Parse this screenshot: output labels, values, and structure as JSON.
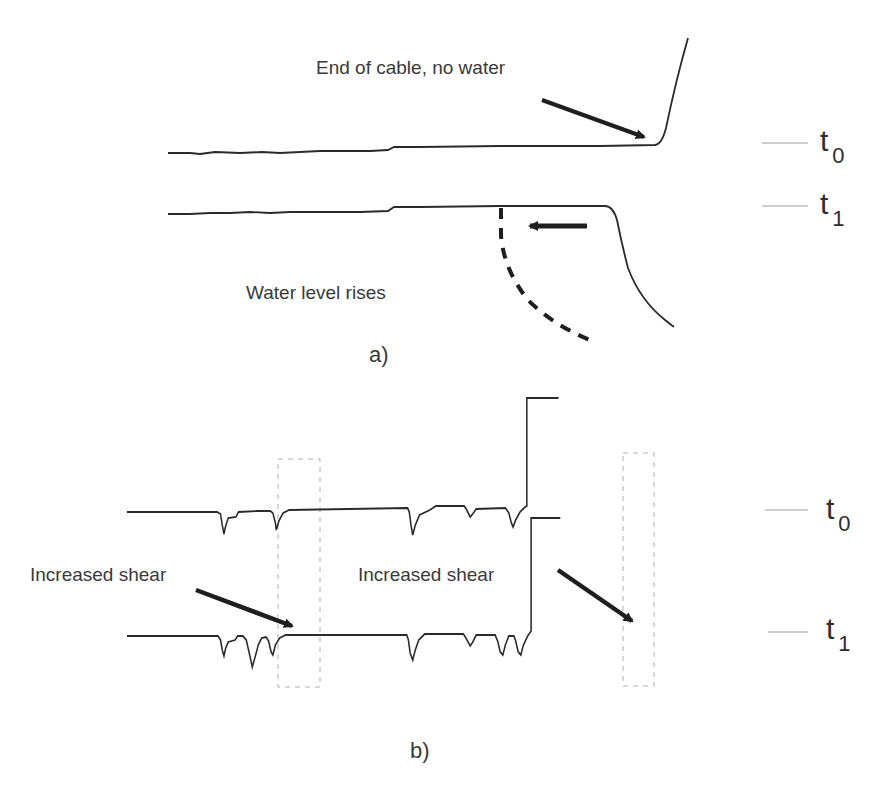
{
  "panel_a": {
    "caption": "a)",
    "annotation_end": "End of cable, no water",
    "annotation_water": "Water level rises",
    "traces": [
      {
        "label_base": "t",
        "label_sub": "0"
      },
      {
        "label_base": "t",
        "label_sub": "1"
      }
    ]
  },
  "panel_b": {
    "caption": "b)",
    "annotation_left": "Increased shear",
    "annotation_right": "Increased shear",
    "traces": [
      {
        "label_base": "t",
        "label_sub": "0"
      },
      {
        "label_base": "t",
        "label_sub": "1"
      }
    ]
  },
  "colors": {
    "trace": "#2a2a2a",
    "arrow": "#1e1e1e",
    "highlight_box": "#b0b0b0",
    "tick": "#a0a0a0"
  }
}
